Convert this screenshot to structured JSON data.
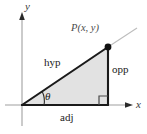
{
  "figure": {
    "colors": {
      "triangle_fill": "#e2e2e2",
      "triangle_stroke": "#1a1a1a",
      "axis": "#9a9a9a",
      "ray": "#b8b8b8",
      "point": "#1a1a1a",
      "background": "#ffffff"
    }
  },
  "labels": {
    "y_axis": "y",
    "x_axis": "x",
    "point": "P(x, y)",
    "hypotenuse": "hyp",
    "opposite": "opp",
    "adjacent": "adj",
    "angle": "θ"
  },
  "geometry": {
    "origin": {
      "x": 22,
      "y": 105
    },
    "right_angle_vertex": {
      "x": 108,
      "y": 105
    },
    "point_P": {
      "x": 108,
      "y": 47
    },
    "ray_end": {
      "x": 137,
      "y": 28
    },
    "x_axis": {
      "x1": 5,
      "x2": 130,
      "y": 105
    },
    "y_axis": {
      "x": 22,
      "y1": 14,
      "y2": 126
    },
    "right_angle_marker_size": 9
  }
}
